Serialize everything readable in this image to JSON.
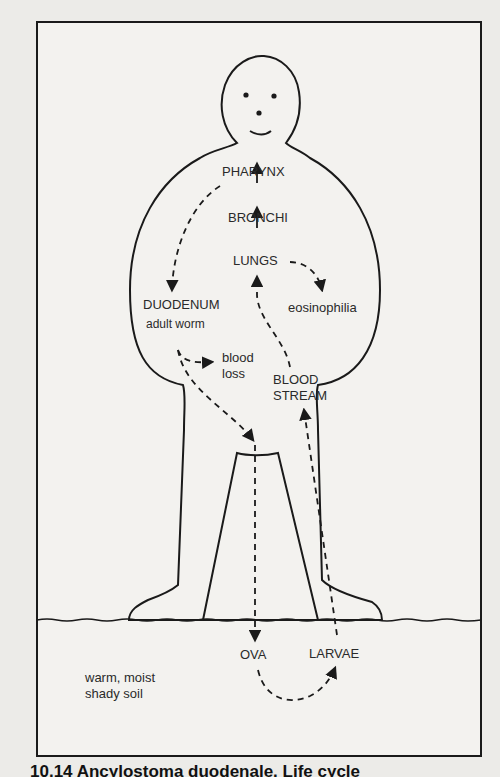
{
  "figure": {
    "caption": "10.14 Ancylostoma duodenale. Life cycle",
    "colors": {
      "background": "#ecebe8",
      "panel": "#f3f2ef",
      "ink": "#1a1a1a"
    }
  },
  "labels": {
    "pharynx": "PHARYNX",
    "bronchi": "BRONCHI",
    "lungs": "LUNGS",
    "eosinophilia": "eosinophilia",
    "duodenum": "DUODENUM",
    "adult_worm": "adult worm",
    "blood_loss_1": "blood",
    "blood_loss_2": "loss",
    "blood_stream_1": "BLOOD",
    "blood_stream_2": "STREAM",
    "ova": "OVA",
    "larvae": "LARVAE",
    "soil_1": "warm, moist",
    "soil_2": "shady soil"
  },
  "cycle": [
    {
      "from": "LARVAE",
      "to": "BLOOD STREAM",
      "style": "dashed"
    },
    {
      "from": "BLOOD STREAM",
      "to": "LUNGS",
      "style": "dashed"
    },
    {
      "from": "LUNGS",
      "to": "BRONCHI",
      "style": "solid"
    },
    {
      "from": "BRONCHI",
      "to": "PHARYNX",
      "style": "solid"
    },
    {
      "from": "LUNGS",
      "to": "eosinophilia",
      "style": "dashed"
    },
    {
      "from": "PHARYNX",
      "to": "DUODENUM",
      "style": "dashed"
    },
    {
      "from": "DUODENUM",
      "to": "blood loss",
      "style": "dashed"
    },
    {
      "from": "DUODENUM",
      "to": "OVA",
      "style": "dashed"
    },
    {
      "from": "OVA",
      "to": "LARVAE",
      "style": "dashed"
    }
  ]
}
